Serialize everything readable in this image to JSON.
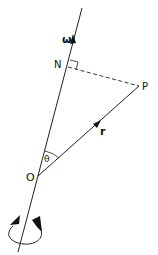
{
  "labels": {
    "omega": "ω",
    "N": "N",
    "P": "P",
    "r": "r",
    "theta": "θ",
    "O": "O"
  },
  "colors": {
    "stroke": "#222222",
    "background": "#ffffff"
  }
}
